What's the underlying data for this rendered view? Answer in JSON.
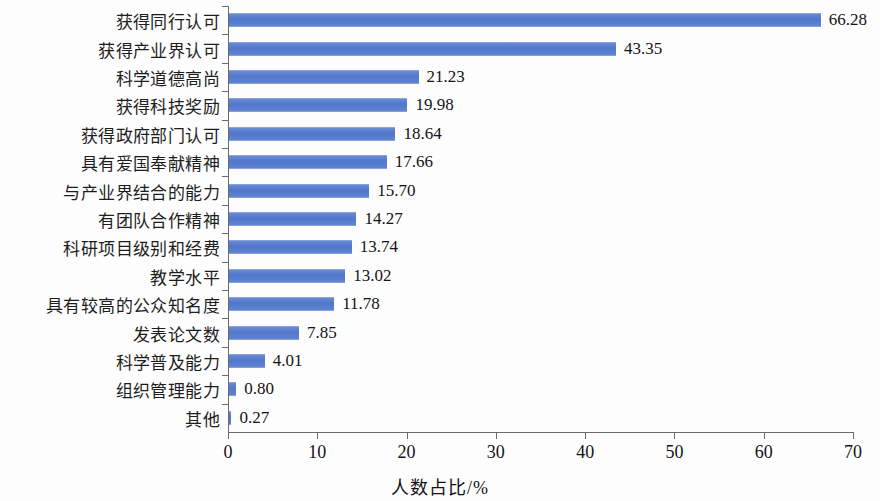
{
  "chart_data": {
    "type": "bar",
    "orientation": "horizontal",
    "title": "",
    "xlabel": "人数占比/%",
    "ylabel": "",
    "xlim": [
      0,
      70
    ],
    "xticks": [
      "0",
      "10",
      "20",
      "30",
      "40",
      "50",
      "60",
      "70"
    ],
    "grid": false,
    "legend": null,
    "bar_color": "#5b7fd1",
    "categories": [
      "获得同行认可",
      "获得产业界认可",
      "科学道德高尚",
      "获得科技奖励",
      "获得政府部门认可",
      "具有爱国奉献精神",
      "与产业界结合的能力",
      "有团队合作精神",
      "科研项目级别和经费",
      "教学水平",
      "具有较高的公众知名度",
      "发表论文数",
      "科学普及能力",
      "组织管理能力",
      "其他"
    ],
    "values": [
      66.28,
      43.35,
      21.23,
      19.98,
      18.64,
      17.66,
      15.7,
      14.27,
      13.74,
      13.02,
      11.78,
      7.85,
      4.01,
      0.8,
      0.27
    ],
    "value_labels": [
      "66.28",
      "43.35",
      "21.23",
      "19.98",
      "18.64",
      "17.66",
      "15.70",
      "14.27",
      "13.74",
      "13.02",
      "11.78",
      "7.85",
      "4.01",
      "0.80",
      "0.27"
    ]
  }
}
